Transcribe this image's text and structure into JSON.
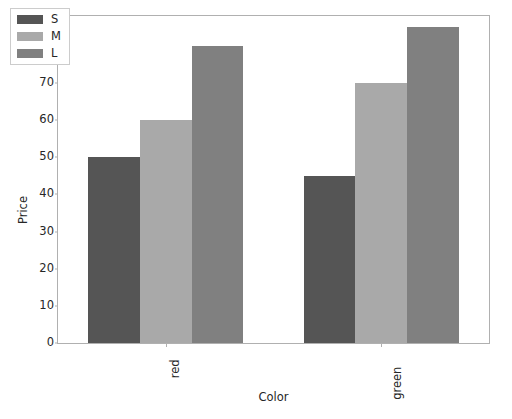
{
  "chart_data": {
    "type": "bar",
    "title": "",
    "xlabel": "Color",
    "ylabel": "Price",
    "categories": [
      "red",
      "green"
    ],
    "series": [
      {
        "name": "S",
        "values": [
          50,
          45
        ],
        "color": "#555555"
      },
      {
        "name": "M",
        "values": [
          60,
          70
        ],
        "color": "#a9a9a9"
      },
      {
        "name": "L",
        "values": [
          80,
          85
        ],
        "color": "#808080"
      }
    ],
    "ylim": [
      0,
      88
    ],
    "yticks": [
      0,
      10,
      20,
      30,
      40,
      50,
      60,
      70,
      80
    ],
    "ytick_labels": [
      "0",
      "10",
      "20",
      "30",
      "40",
      "50",
      "60",
      "70",
      "80"
    ],
    "xtick_labels": [
      "red",
      "green"
    ],
    "xtick_rotation": 90,
    "grid": false,
    "legend": {
      "position": "upper-left",
      "entries": [
        "S",
        "M",
        "L"
      ]
    },
    "axes_edge_color": "#b0b0b0",
    "text_color": "#262626",
    "background": "#ffffff"
  }
}
